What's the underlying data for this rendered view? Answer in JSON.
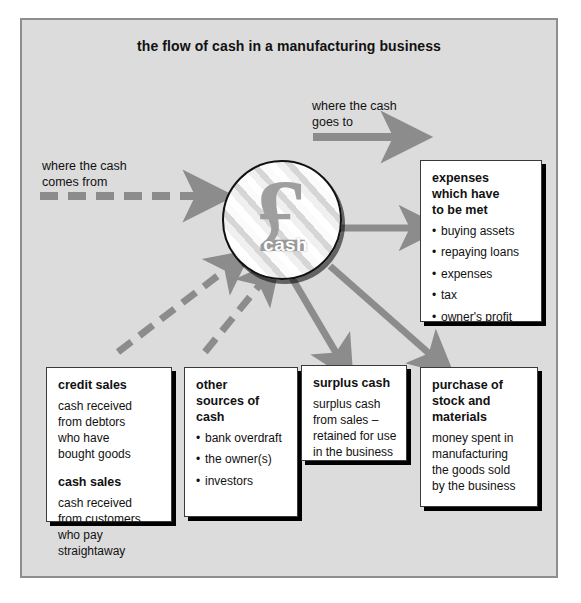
{
  "diagram": {
    "title": "the flow of cash in a manufacturing business",
    "legend": {
      "inflow_label": "where the cash\ncomes from",
      "inflow_arrow_style": "dashed",
      "outflow_label": "where the cash\ngoes to",
      "outflow_arrow_style": "solid"
    },
    "center": {
      "symbol": "£",
      "symbol_name": "pound-sterling-symbol",
      "label": "cash"
    },
    "boxes": [
      {
        "id": "expenses",
        "heading": "expenses\nwhich have\nto be met",
        "items": [
          "buying assets",
          "repaying loans",
          "expenses",
          "tax",
          "owner's profit"
        ],
        "body": "",
        "flow": "outflow"
      },
      {
        "id": "credit-sales",
        "heading": "credit sales",
        "body": "cash received\nfrom debtors\nwho have\nbought goods",
        "heading2": "cash sales",
        "body2": "cash received\nfrom customers\nwho pay\nstraightaway",
        "items": [],
        "flow": "inflow"
      },
      {
        "id": "other-sources",
        "heading": "other\nsources of\ncash",
        "items": [
          "bank overdraft",
          "the owner(s)",
          "investors"
        ],
        "body": "",
        "flow": "inflow"
      },
      {
        "id": "surplus-cash",
        "heading": "surplus cash",
        "body": "surplus cash\nfrom sales –\nretained for use\nin the business",
        "items": [],
        "flow": "outflow"
      },
      {
        "id": "purchase-stock",
        "heading": "purchase of\nstock and\nmaterials",
        "body": "money spent in\nmanufacturing\nthe goods sold\nby the business",
        "items": [],
        "flow": "outflow"
      }
    ],
    "colors": {
      "background": "#dcdcdc",
      "frame_border": "#8e8e8e",
      "arrow": "#8c8c8c",
      "box_fill": "#ffffff",
      "box_border": "#3a3a3a",
      "shadow": "#000000",
      "text": "#111111"
    }
  }
}
